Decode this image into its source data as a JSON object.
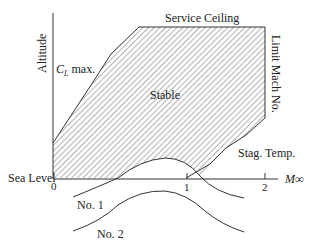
{
  "diagram": {
    "axes": {
      "y_label": "Altitude",
      "x_label": "M∞",
      "origin_label": "0",
      "baseline_label": "Sea Level",
      "x_ticks": [
        "1",
        "2"
      ]
    },
    "regions": {
      "stable_label": "Stable"
    },
    "boundaries": {
      "cl_max": "C",
      "cl_max_sub": "L",
      "cl_max_suffix": " max.",
      "service_ceiling": "Service Ceiling",
      "limit_mach": "Limit Mach No.",
      "stag_temp": "Stag. Temp."
    },
    "curves": {
      "no1": "No. 1",
      "no2": "No. 2"
    },
    "colors": {
      "line": "#333333",
      "hatch": "#555555",
      "background": "#ffffff"
    }
  }
}
